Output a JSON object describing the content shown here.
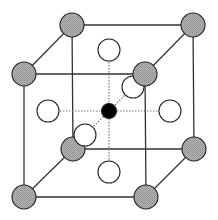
{
  "diagram": {
    "type": "crystal-lattice-unit-cell",
    "colors": {
      "edge": "#333333",
      "corner_fill": "#a8a8a8",
      "face_fill": "#ffffff",
      "center_fill": "#000000",
      "dashed": "#777777"
    },
    "corner_radius": 12,
    "face_radius": 11,
    "center_radius": 7.5,
    "corners": [
      {
        "id": "back-top-left",
        "x": 72,
        "y": 25
      },
      {
        "id": "back-top-right",
        "x": 193,
        "y": 25
      },
      {
        "id": "back-bottom-left",
        "x": 73,
        "y": 149
      },
      {
        "id": "back-bottom-right",
        "x": 194,
        "y": 149
      },
      {
        "id": "front-top-left",
        "x": 24,
        "y": 74
      },
      {
        "id": "front-top-right",
        "x": 145,
        "y": 74
      },
      {
        "id": "front-bottom-left",
        "x": 24,
        "y": 197
      },
      {
        "id": "front-bottom-right",
        "x": 146,
        "y": 197
      }
    ],
    "faces": [
      {
        "id": "top",
        "x": 109,
        "y": 50
      },
      {
        "id": "bottom",
        "x": 109,
        "y": 172
      },
      {
        "id": "left",
        "x": 48,
        "y": 111
      },
      {
        "id": "right",
        "x": 170,
        "y": 111
      },
      {
        "id": "back",
        "x": 133,
        "y": 87
      },
      {
        "id": "front",
        "x": 85,
        "y": 135
      }
    ],
    "center": {
      "id": "body-center",
      "x": 109,
      "y": 111
    }
  }
}
